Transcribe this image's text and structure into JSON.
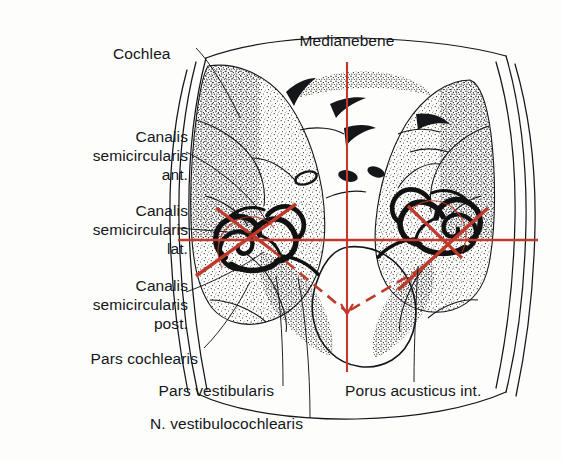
{
  "figure": {
    "type": "anatomical-line-drawing",
    "language": "la-de",
    "colors": {
      "ink": "#15161a",
      "stipple": "#2b2b2b",
      "axis_red": "#c0392b",
      "background": "#fdfdfb"
    }
  },
  "labels": {
    "cochlea": "Cochlea",
    "canalis_semicircularis_ant": {
      "line1": "Canalis",
      "line2": "semicircularis",
      "line3": "ant."
    },
    "canalis_semicircularis_lat": {
      "line1": "Canalis",
      "line2": "semicircularis",
      "line3": "lat."
    },
    "canalis_semicircularis_post": {
      "line1": "Canalis",
      "line2": "semicircularis",
      "line3": "post."
    },
    "pars_cochlearis": "Pars cochlearis",
    "pars_vestibularis": "Pars vestibularis",
    "n_vestibulocochlearis": "N. vestibulocochlearis",
    "medianebene": "Medianebene",
    "porus_acusticus_int": "Porus acusticus int."
  },
  "annotations": {
    "median_plane_axis": "vertical red line through midline",
    "horizontal_axis": "horizontal red line through both internal ears",
    "oblique_axes": "red oblique lines marking semicircular canal planes",
    "dashed_axes": "dashed red lines converging at foramen magnum"
  }
}
